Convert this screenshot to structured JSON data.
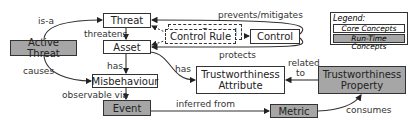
{
  "nodes": {
    "threat": "Threat",
    "asset": "Asset",
    "control_rule": "Control Rule",
    "control_shadow": "Control",
    "control": "Control",
    "active_threat": "Active Threat",
    "misbehaviour": "Misbehaviour",
    "tw_attribute": "Trustworthiness Attribute",
    "tw_property": "Trustworthiness Property",
    "event": "Event",
    "metric": "Metric"
  },
  "edges": {
    "is_a": "is-a",
    "threatens": "threatens",
    "prevents_mitigates": "prevents/mitigates",
    "protects": "protects",
    "causes": "causes",
    "has_1": "has",
    "has_2": "has",
    "related_to_1": "related",
    "related_to_2": "to",
    "observable_via": "observable via",
    "inferred_from": "inferred from",
    "consumes": "consumes"
  },
  "legend": {
    "title": "Legend:",
    "core": "Core Concepts",
    "runtime": "Run-Time Concepts"
  },
  "colors": {
    "core_fill": "#ffffff",
    "runtime_fill": "#a6a6a6",
    "stroke": "#333333"
  }
}
